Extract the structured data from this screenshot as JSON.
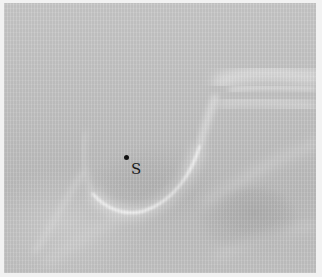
{
  "image": {
    "type": "radiograph",
    "description": "Lateral cephalometric X-ray detail showing sella turcica region",
    "colors": {
      "background": "#c4c4c4",
      "bone_edge": "#ececec",
      "border": "#f2f2f2",
      "landmark": "#111111"
    }
  },
  "landmarks": [
    {
      "label": "S",
      "x": 126,
      "y": 158
    }
  ]
}
